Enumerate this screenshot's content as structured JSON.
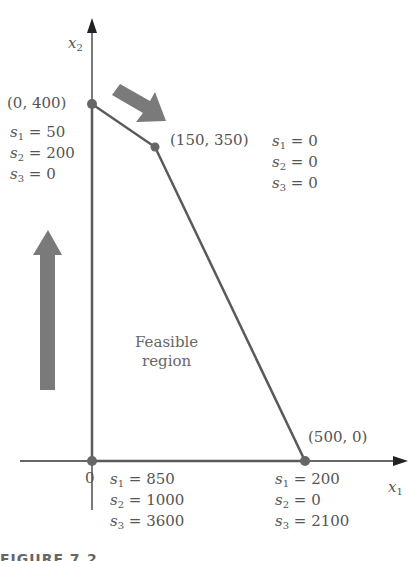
{
  "diagram": {
    "axes": {
      "x_label": "x",
      "x_sub": "1",
      "y_label": "x",
      "y_sub": "2",
      "origin_label": "0"
    },
    "region_label": [
      "Feasible",
      "region"
    ],
    "vertices": [
      {
        "coord": "(0, 400)",
        "slacks": [
          "= 50",
          "= 200",
          "= 0"
        ]
      },
      {
        "coord": "(150, 350)",
        "slacks": [
          "= 0",
          "= 0",
          "= 0"
        ]
      },
      {
        "coord": "(500, 0)",
        "slacks": [
          "= 200",
          "= 0",
          "= 2100"
        ]
      },
      {
        "coord": "0",
        "slacks": [
          "= 850",
          "= 1000",
          "= 3600"
        ]
      }
    ],
    "slack_var": "s",
    "figure_caption": "FIGURE 7.2",
    "colors": {
      "line": "#5a5a5a",
      "arrow": "#7a7a7a",
      "text": "#555555"
    }
  }
}
